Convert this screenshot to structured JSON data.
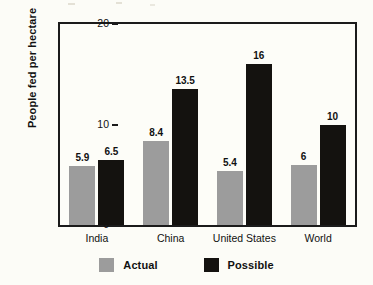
{
  "chart_data": {
    "type": "bar",
    "title": "",
    "xlabel": "",
    "ylabel": "People fed per hectare",
    "categories": [
      "India",
      "China",
      "United States",
      "World"
    ],
    "series": [
      {
        "name": "Actual",
        "color": "#9c9c9c",
        "values": [
          5.9,
          8.4,
          5.4,
          6
        ]
      },
      {
        "name": "Possible",
        "color": "#14120f",
        "values": [
          6.5,
          13.5,
          16,
          10
        ]
      }
    ],
    "value_labels": {
      "Actual": [
        "5.9",
        "8.4",
        "5.4",
        "6"
      ],
      "Possible": [
        "6.5",
        "13.5",
        "16",
        "10"
      ]
    },
    "ylim": [
      0,
      20
    ],
    "yticks": [
      0,
      10,
      20
    ],
    "ytick_labels": [
      "0",
      "10",
      "20"
    ],
    "grid": false,
    "legend_position": "bottom",
    "legend": [
      "Actual",
      "Possible"
    ]
  },
  "colors": {
    "page_background": "#fcfcf7",
    "plot_background": "#fdfdf8",
    "axis": "#1b1b1b",
    "actual": "#9c9c9c",
    "possible": "#14120f",
    "text": "#111111"
  }
}
